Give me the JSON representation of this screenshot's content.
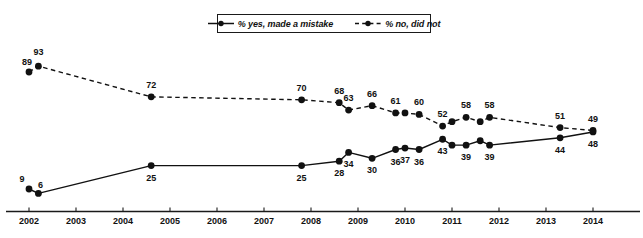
{
  "chart_data": {
    "type": "line",
    "title": "",
    "xlabel": "",
    "ylabel": "",
    "xlim": [
      2002,
      2014
    ],
    "ylim": [
      0,
      100
    ],
    "grid": false,
    "legend_position": "top-center",
    "x_ticks": [
      "2002",
      "2003",
      "2004",
      "2005",
      "2006",
      "2007",
      "2008",
      "2009",
      "2010",
      "2011",
      "2012",
      "2013",
      "2014"
    ],
    "series": [
      {
        "name": "% yes, made a mistake",
        "style": "solid",
        "marker": "filled-circle",
        "label_position": "below",
        "points": [
          {
            "x": 2002.0,
            "y": 9,
            "label": "9"
          },
          {
            "x": 2002.2,
            "y": 6,
            "label": "6"
          },
          {
            "x": 2004.6,
            "y": 25,
            "label": "25"
          },
          {
            "x": 2007.8,
            "y": 25,
            "label": "25"
          },
          {
            "x": 2008.6,
            "y": 28,
            "label": "28"
          },
          {
            "x": 2008.8,
            "y": 34,
            "label": "34"
          },
          {
            "x": 2009.3,
            "y": 30,
            "label": "30"
          },
          {
            "x": 2009.8,
            "y": 36,
            "label": "36"
          },
          {
            "x": 2010.0,
            "y": 37,
            "label": "37"
          },
          {
            "x": 2010.3,
            "y": 36,
            "label": "36"
          },
          {
            "x": 2010.8,
            "y": 43,
            "label": "43"
          },
          {
            "x": 2011.0,
            "y": 39,
            "label": ""
          },
          {
            "x": 2011.3,
            "y": 39,
            "label": "39"
          },
          {
            "x": 2011.6,
            "y": 42,
            "label": ""
          },
          {
            "x": 2011.8,
            "y": 39,
            "label": "39"
          },
          {
            "x": 2013.3,
            "y": 44,
            "label": "44"
          },
          {
            "x": 2014.0,
            "y": 48,
            "label": "48"
          }
        ]
      },
      {
        "name": "% no, did not",
        "style": "dashed",
        "marker": "filled-circle",
        "label_position": "above",
        "points": [
          {
            "x": 2002.0,
            "y": 89,
            "label": "89"
          },
          {
            "x": 2002.2,
            "y": 93,
            "label": "93"
          },
          {
            "x": 2004.6,
            "y": 72,
            "label": "72"
          },
          {
            "x": 2007.8,
            "y": 70,
            "label": "70"
          },
          {
            "x": 2008.6,
            "y": 68,
            "label": "68"
          },
          {
            "x": 2008.8,
            "y": 63,
            "label": "63"
          },
          {
            "x": 2009.3,
            "y": 66,
            "label": "66"
          },
          {
            "x": 2009.8,
            "y": 61,
            "label": "61"
          },
          {
            "x": 2010.0,
            "y": 61,
            "label": ""
          },
          {
            "x": 2010.3,
            "y": 60,
            "label": "60"
          },
          {
            "x": 2010.8,
            "y": 52,
            "label": "52"
          },
          {
            "x": 2011.0,
            "y": 55,
            "label": ""
          },
          {
            "x": 2011.3,
            "y": 58,
            "label": "58"
          },
          {
            "x": 2011.6,
            "y": 55,
            "label": ""
          },
          {
            "x": 2011.8,
            "y": 58,
            "label": "58"
          },
          {
            "x": 2013.3,
            "y": 51,
            "label": "51"
          },
          {
            "x": 2014.0,
            "y": 49,
            "label": "49"
          }
        ]
      }
    ]
  },
  "legend": {
    "entries": [
      {
        "label": "% yes, made a mistake",
        "style": "solid"
      },
      {
        "label": "% no, did not",
        "style": "dashed"
      }
    ]
  },
  "colors": {
    "ink": "#111111",
    "axis": "#1a1a1a",
    "background": "#ffffff"
  }
}
